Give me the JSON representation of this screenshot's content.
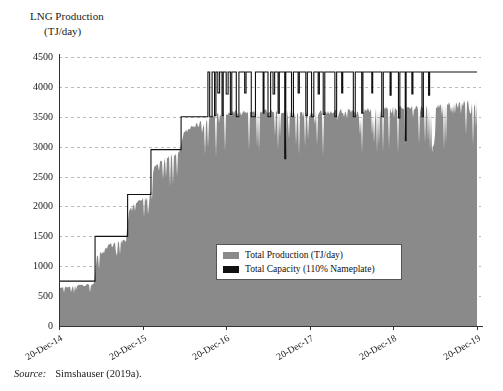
{
  "figure": {
    "axis_title_line1": "LNG Production",
    "axis_title_line2": "(TJ/day)",
    "source_label": "Source:",
    "source_text": "Simshauser (2019a)."
  },
  "legend": {
    "position": "inside-center",
    "entries": [
      {
        "label": "Total Production (TJ/day)",
        "color": "#8a8a8a",
        "name": "total-production"
      },
      {
        "label": "Total Capacity (110% Nameplate)",
        "color": "#111111",
        "name": "total-capacity"
      }
    ]
  },
  "colors": {
    "production_fill": "#8a8a8a",
    "capacity_line": "#111111",
    "gridline": "#b9b9c6",
    "axis": "#333333",
    "background": "#ffffff"
  },
  "chart_data": {
    "type": "area",
    "title": "LNG Production (TJ/day)",
    "xlabel": "",
    "ylabel": "LNG Production (TJ/day)",
    "ylim": [
      0,
      4500
    ],
    "yticks": [
      0,
      500,
      1000,
      1500,
      2000,
      2500,
      3000,
      3500,
      4000,
      4500
    ],
    "ytick_labels": [
      "0",
      "500",
      "1000",
      "1500",
      "2000",
      "2500",
      "3000",
      "3500",
      "4000",
      "4500"
    ],
    "xticks": [
      "20-Dec-14",
      "20-Dec-15",
      "20-Dec-16",
      "20-Dec-17",
      "20-Dec-18",
      "20-Dec-19"
    ],
    "xtick_rotation_deg": -30,
    "grid": "horizontal-dashed",
    "x_range_years": [
      0,
      5
    ],
    "series": [
      {
        "name": "Total Capacity (110% Nameplate)",
        "type": "step",
        "color": "#111111",
        "steps": [
          {
            "x": 0.0,
            "y": 750
          },
          {
            "x": 0.43,
            "y": 1500
          },
          {
            "x": 0.82,
            "y": 2200
          },
          {
            "x": 1.1,
            "y": 2950
          },
          {
            "x": 1.46,
            "y": 3500
          },
          {
            "x": 1.78,
            "y": 4250
          },
          {
            "x": 5.0,
            "y": 4250
          }
        ],
        "dip_events": [
          {
            "x": 1.8,
            "width": 0.03,
            "y": 3500
          },
          {
            "x": 1.86,
            "width": 0.016,
            "y": 3520
          },
          {
            "x": 1.9,
            "width": 0.02,
            "y": 3900
          },
          {
            "x": 1.95,
            "width": 0.014,
            "y": 3520
          },
          {
            "x": 2.0,
            "width": 0.022,
            "y": 3880
          },
          {
            "x": 2.05,
            "width": 0.016,
            "y": 3540
          },
          {
            "x": 2.12,
            "width": 0.03,
            "y": 3500
          },
          {
            "x": 2.22,
            "width": 0.016,
            "y": 3900
          },
          {
            "x": 2.3,
            "width": 0.048,
            "y": 3500
          },
          {
            "x": 2.44,
            "width": 0.012,
            "y": 3560
          },
          {
            "x": 2.5,
            "width": 0.03,
            "y": 3500
          },
          {
            "x": 2.56,
            "width": 0.018,
            "y": 3880
          },
          {
            "x": 2.62,
            "width": 0.014,
            "y": 3560
          },
          {
            "x": 2.7,
            "width": 0.012,
            "y": 2800
          },
          {
            "x": 2.78,
            "width": 0.024,
            "y": 3500
          },
          {
            "x": 2.86,
            "width": 0.014,
            "y": 3900
          },
          {
            "x": 2.95,
            "width": 0.02,
            "y": 3520
          },
          {
            "x": 3.02,
            "width": 0.026,
            "y": 3500
          },
          {
            "x": 3.1,
            "width": 0.014,
            "y": 3880
          },
          {
            "x": 3.16,
            "width": 0.018,
            "y": 3540
          },
          {
            "x": 3.3,
            "width": 0.02,
            "y": 3500
          },
          {
            "x": 3.38,
            "width": 0.012,
            "y": 3900
          },
          {
            "x": 3.52,
            "width": 0.022,
            "y": 3500
          },
          {
            "x": 3.62,
            "width": 0.014,
            "y": 3560
          },
          {
            "x": 3.74,
            "width": 0.012,
            "y": 3900
          },
          {
            "x": 3.86,
            "width": 0.018,
            "y": 3500
          },
          {
            "x": 3.96,
            "width": 0.012,
            "y": 3860
          },
          {
            "x": 4.06,
            "width": 0.016,
            "y": 3480
          },
          {
            "x": 4.14,
            "width": 0.01,
            "y": 3100
          },
          {
            "x": 4.22,
            "width": 0.012,
            "y": 3880
          },
          {
            "x": 4.34,
            "width": 0.018,
            "y": 3500
          },
          {
            "x": 4.42,
            "width": 0.012,
            "y": 3860
          }
        ]
      },
      {
        "name": "Total Production (TJ/day)",
        "type": "area-noisy",
        "color": "#8a8a8a",
        "envelope": [
          {
            "x": 0.0,
            "y": 640
          },
          {
            "x": 0.2,
            "y": 690
          },
          {
            "x": 0.42,
            "y": 720
          },
          {
            "x": 0.45,
            "y": 1180
          },
          {
            "x": 0.62,
            "y": 1400
          },
          {
            "x": 0.8,
            "y": 1460
          },
          {
            "x": 0.84,
            "y": 1980
          },
          {
            "x": 1.0,
            "y": 2150
          },
          {
            "x": 1.08,
            "y": 2180
          },
          {
            "x": 1.14,
            "y": 2700
          },
          {
            "x": 1.3,
            "y": 2880
          },
          {
            "x": 1.44,
            "y": 2920
          },
          {
            "x": 1.5,
            "y": 3280
          },
          {
            "x": 1.66,
            "y": 3420
          },
          {
            "x": 1.76,
            "y": 3460
          },
          {
            "x": 1.84,
            "y": 3560
          },
          {
            "x": 2.1,
            "y": 3620
          },
          {
            "x": 2.5,
            "y": 3640
          },
          {
            "x": 3.0,
            "y": 3600
          },
          {
            "x": 3.5,
            "y": 3640
          },
          {
            "x": 4.0,
            "y": 3680
          },
          {
            "x": 4.4,
            "y": 3700
          },
          {
            "x": 4.7,
            "y": 3760
          },
          {
            "x": 5.0,
            "y": 3800
          }
        ],
        "noise_depth_fraction": 0.22,
        "description": "Daily LNG production ramping from ~650 TJ/day in Dec-2014 to ~3700 TJ/day by Dec-2019, with high day-to-day variability shown as downward spikes."
      }
    ]
  },
  "axes_geometry": {
    "plot_left": 59,
    "plot_right": 477,
    "plot_top": 57,
    "plot_bottom": 326
  }
}
